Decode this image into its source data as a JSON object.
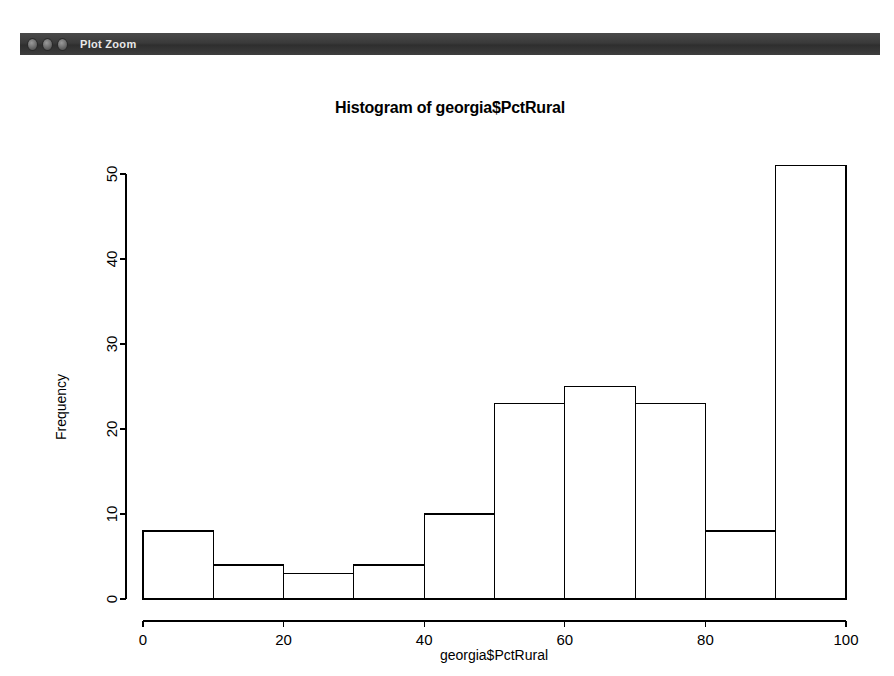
{
  "window": {
    "title": "Plot Zoom",
    "controls": [
      {
        "name": "close-button",
        "label": ""
      },
      {
        "name": "minimize-button",
        "label": ""
      },
      {
        "name": "maximize-button",
        "label": ""
      }
    ]
  },
  "chart_data": {
    "type": "bar",
    "title": "Histogram of georgia$PctRural",
    "xlabel": "georgia$PctRural",
    "ylabel": "Frequency",
    "categories": [
      "0-10",
      "10-20",
      "20-30",
      "30-40",
      "40-50",
      "50-60",
      "60-70",
      "70-80",
      "80-90",
      "90-100"
    ],
    "bin_edges": [
      0,
      10,
      20,
      30,
      40,
      50,
      60,
      70,
      80,
      90,
      100
    ],
    "values": [
      8,
      4,
      3,
      4,
      10,
      23,
      25,
      23,
      8,
      51
    ],
    "xlim": [
      0,
      100
    ],
    "ylim": [
      0,
      51
    ],
    "xticks": [
      0,
      20,
      40,
      60,
      80,
      100
    ],
    "xtick_labels": [
      "0",
      "20",
      "40",
      "60",
      "80",
      "100"
    ],
    "yticks": [
      0,
      10,
      20,
      30,
      40,
      50
    ],
    "ytick_labels": [
      "0",
      "10",
      "20",
      "30",
      "40",
      "50"
    ],
    "grid": false,
    "legend": null,
    "bar_fill_color": "#ffffff",
    "bar_edge_color": "#000000",
    "background_color": "#ffffff"
  }
}
